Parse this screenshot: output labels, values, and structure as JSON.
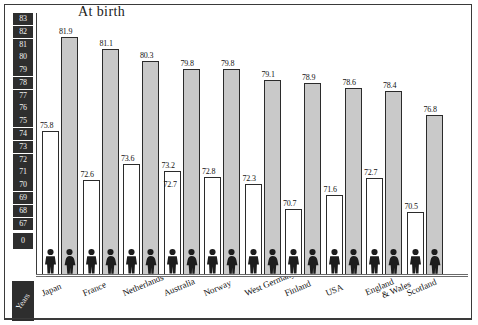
{
  "chart_data": {
    "type": "bar",
    "title": "At birth",
    "xlabel": "",
    "ylabel": "Years",
    "ylim": [
      67,
      83
    ],
    "y_axis_broken_at_zero": true,
    "grid": false,
    "legend_position": "none",
    "categories": [
      "Japan",
      "France",
      "Netherlands",
      "Australia",
      "Norway",
      "West Germany",
      "Finland",
      "USA",
      "England & Wales",
      "Scotland"
    ],
    "yticks": [
      "83",
      "82",
      "81",
      "80",
      "79",
      "78",
      "77",
      "76",
      "75",
      "74",
      "73",
      "72",
      "71",
      "70",
      "69",
      "68",
      "67",
      "0"
    ],
    "series": [
      {
        "name": "Male",
        "values": [
          75.8,
          72.6,
          73.6,
          73.2,
          72.8,
          72.3,
          70.7,
          71.6,
          72.7,
          70.5
        ]
      },
      {
        "name": "Female",
        "values": [
          81.9,
          81.1,
          80.3,
          79.8,
          79.8,
          79.1,
          78.9,
          78.6,
          78.4,
          76.8
        ]
      }
    ],
    "annotations": [
      {
        "category": "Australia",
        "value": 72.7,
        "note": "secondary male figure shown below bar top"
      }
    ]
  },
  "axis": {
    "unit_label": "Years",
    "zero_label": "0"
  },
  "colors": {
    "female_bar_fill": "#c9c9c9",
    "male_bar_fill": "#ffffff",
    "bar_stroke": "#2b2b2b",
    "tick_box_bg": "#2e2e2e",
    "tick_box_text": "#f2f2f2",
    "frame": "#3a3a3a"
  },
  "icons": {
    "male": "male-figure-icon",
    "female": "female-figure-icon"
  }
}
